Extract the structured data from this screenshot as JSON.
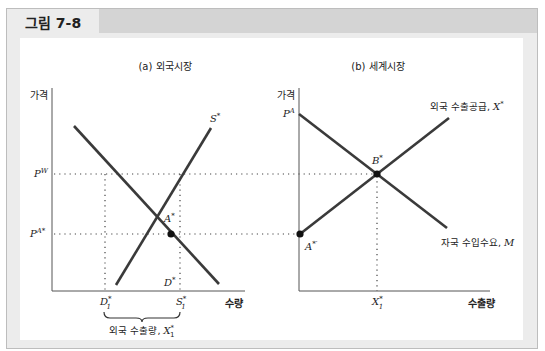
{
  "figure": {
    "title": "그림 7-8"
  },
  "panel_a": {
    "title": "(a) 외국시장",
    "y_axis_label": "가격",
    "x_axis_label": "수량",
    "price_labels": {
      "world": "P",
      "world_sup": "W",
      "autarky": "P",
      "autarky_sup": "A*"
    },
    "curve_labels": {
      "supply": "S",
      "supply_sup": "*",
      "demand": "D",
      "demand_sup": "*"
    },
    "point_label": "A",
    "point_sup": "*",
    "x_ticks": {
      "d1": "D",
      "d1_sup": "*",
      "d1_sub": "1",
      "s1": "S",
      "s1_sup": "*",
      "s1_sub": "1"
    },
    "brace_label_text": "외국 수출량, ",
    "brace_label_var": "X",
    "brace_label_sup": "*",
    "brace_label_sub": "1"
  },
  "panel_b": {
    "title": "(b) 세계시장",
    "y_axis_label": "가격",
    "x_axis_label": "수출량",
    "price_label": "P",
    "price_sup": "A",
    "supply_label_text": "외국 수출공급, ",
    "supply_label_var": "X",
    "supply_label_sup": "*",
    "demand_label_text": "자국 수입수요, ",
    "demand_label_var": "M",
    "point_b": "B",
    "point_b_sup": "*",
    "point_a": "A",
    "point_a_sup": "*′",
    "x_tick": "X",
    "x_tick_sup": "*",
    "x_tick_sub": "1"
  },
  "colors": {
    "line": "#3a3a3a",
    "axis": "#555555",
    "frame_bg": "#ececec",
    "header_dark": "#d4d4d4"
  }
}
